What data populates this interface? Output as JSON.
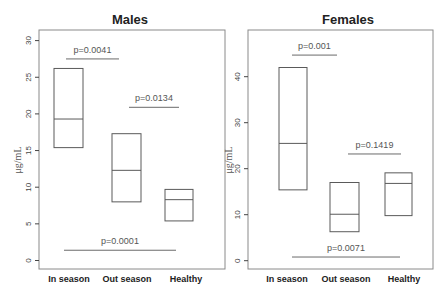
{
  "chart_data": [
    {
      "type": "box",
      "title": "Males",
      "xlabel": "",
      "ylabel": "μg/mL",
      "ylim": [
        0,
        31
      ],
      "yticks": [
        0,
        5,
        10,
        15,
        20,
        25,
        30
      ],
      "categories": [
        "In season",
        "Out season",
        "Healthy"
      ],
      "boxes": [
        {
          "category": "In season",
          "q1": 15.4,
          "median": 19.3,
          "q3": 26.2
        },
        {
          "category": "Out season",
          "q1": 8.0,
          "median": 12.3,
          "q3": 17.3
        },
        {
          "category": "Healthy",
          "q1": 5.4,
          "median": 8.3,
          "q3": 9.7
        }
      ],
      "annotations": [
        {
          "label": "p=0.0041",
          "from": "In season",
          "to": "Out season",
          "y": 27.5
        },
        {
          "label": "p=0.0134",
          "from": "Out season",
          "to": "Healthy",
          "y": 20.9
        },
        {
          "label": "p=0.0001",
          "from": "In season",
          "to": "Healthy",
          "y": 1.4
        }
      ],
      "grid": false,
      "legend": null
    },
    {
      "type": "box",
      "title": "Females",
      "xlabel": "",
      "ylabel": "μg/mL",
      "ylim": [
        0,
        49
      ],
      "yticks": [
        0,
        10,
        20,
        30,
        40
      ],
      "categories": [
        "In season",
        "Out season",
        "Healthy"
      ],
      "boxes": [
        {
          "category": "In season",
          "q1": 15.4,
          "median": 25.5,
          "q3": 42.0
        },
        {
          "category": "Out season",
          "q1": 6.3,
          "median": 10.1,
          "q3": 17.0
        },
        {
          "category": "Healthy",
          "q1": 9.8,
          "median": 16.8,
          "q3": 19.1
        }
      ],
      "annotations": [
        {
          "label": "p=0.001",
          "from": "In season",
          "to": "Out season",
          "y": 44.7
        },
        {
          "label": "p=0.1419",
          "from": "Out season",
          "to": "Healthy",
          "y": 23.2
        },
        {
          "label": "p=0.0071",
          "from": "In season",
          "to": "Healthy",
          "y": 0.8
        }
      ],
      "grid": false,
      "legend": null
    }
  ],
  "layout": {
    "panels": [
      {
        "frame": {
          "x": 39,
          "y": 30,
          "w": 186,
          "h": 239
        },
        "y0px": 260.5,
        "pxPerUnit": 7.33,
        "boxX": [
          [
            54,
            83
          ],
          [
            112,
            141
          ],
          [
            165,
            193
          ]
        ],
        "labelX": [
          69,
          127,
          186
        ],
        "titleX": 130,
        "ylabelX": 21,
        "ylabelY": 160,
        "bracketX": [
          [
            66,
            119
          ],
          [
            129,
            179
          ],
          [
            64,
            176
          ]
        ],
        "bracketTextDy": [
          -6,
          -6,
          -6
        ]
      },
      {
        "frame": {
          "x": 248,
          "y": 30,
          "w": 185,
          "h": 239
        },
        "y0px": 260.7,
        "pxPerUnit": 4.6,
        "boxX": [
          [
            279,
            307
          ],
          [
            330,
            359
          ],
          [
            385,
            412
          ]
        ],
        "labelX": [
          287,
          346,
          404
        ],
        "titleX": 348,
        "ylabelX": 232,
        "ylabelY": 160,
        "bracketX": [
          [
            292,
            337
          ],
          [
            348,
            401
          ],
          [
            292,
            400
          ]
        ],
        "bracketTextDy": [
          -6,
          -6,
          -6
        ]
      }
    ]
  }
}
